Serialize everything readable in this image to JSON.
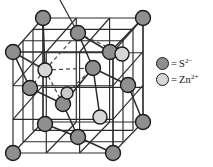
{
  "figure": {
    "name": "zinc-blende-unit-cell",
    "background_color": "#ffffff"
  },
  "colors": {
    "anion_fill": "#8f8f8f",
    "cation_fill": "#d6d6d6",
    "outline": "#1b1b1b",
    "edge_line": "#2b2b2b",
    "bond_line": "#2b2b2b",
    "dashed_line": "#4a4a4a"
  },
  "legend": {
    "name": "species-legend",
    "items": [
      {
        "swatch": "anion",
        "equals": "=",
        "formula": "S",
        "charge": "2−",
        "label": "= S2−"
      },
      {
        "swatch": "cation",
        "equals": "=",
        "formula": "Zn",
        "charge": "2+",
        "label": "= Zn2+"
      }
    ]
  },
  "lattice": {
    "cube": {
      "front_face": [
        [
          13,
          52
        ],
        [
          113,
          52
        ],
        [
          113,
          153
        ],
        [
          13,
          153
        ]
      ],
      "back_face": [
        [
          43,
          18
        ],
        [
          143,
          18
        ],
        [
          143,
          122
        ],
        [
          43,
          122
        ]
      ],
      "connectors": [
        [
          [
            13,
            52
          ],
          [
            43,
            18
          ]
        ],
        [
          [
            113,
            52
          ],
          [
            143,
            18
          ]
        ],
        [
          [
            113,
            153
          ],
          [
            143,
            122
          ]
        ],
        [
          [
            13,
            153
          ],
          [
            43,
            122
          ]
        ]
      ]
    },
    "grid_lines_per_face": 2,
    "anions": [
      {
        "id": "S-back-top-left",
        "x": 43,
        "y": 18,
        "r": 7.5
      },
      {
        "id": "S-back-top-right",
        "x": 143,
        "y": 18,
        "r": 7.5
      },
      {
        "id": "S-front-top-left",
        "x": 13,
        "y": 52,
        "r": 7.5
      },
      {
        "id": "S-top-face-center",
        "x": 78,
        "y": 33,
        "r": 7.5
      },
      {
        "id": "S-right-face-upper",
        "x": 110,
        "y": 52,
        "r": 7.5
      },
      {
        "id": "S-interior-center",
        "x": 93,
        "y": 68,
        "r": 7.5
      },
      {
        "id": "S-left-face-center",
        "x": 30,
        "y": 88,
        "r": 7.5
      },
      {
        "id": "S-front-face-center",
        "x": 63,
        "y": 104,
        "r": 7.5
      },
      {
        "id": "S-right-face-center",
        "x": 128,
        "y": 85,
        "r": 7.5
      },
      {
        "id": "S-bottom-face-center",
        "x": 78,
        "y": 137,
        "r": 7.5
      },
      {
        "id": "S-back-bottom-right",
        "x": 143,
        "y": 122,
        "r": 7.5
      },
      {
        "id": "S-front-bottom-left",
        "x": 13,
        "y": 153,
        "r": 7.5
      },
      {
        "id": "S-front-bottom-right",
        "x": 113,
        "y": 153,
        "r": 7.5
      },
      {
        "id": "S-back-bottom-left",
        "x": 45,
        "y": 124,
        "r": 7.5
      }
    ],
    "cations": [
      {
        "id": "Zn-upper-left-interior",
        "x": 45,
        "y": 70,
        "r": 7.0
      },
      {
        "id": "Zn-upper-right-interior",
        "x": 122,
        "y": 54,
        "r": 7.0
      },
      {
        "id": "Zn-mid-interior",
        "x": 67,
        "y": 93,
        "r": 6.0
      },
      {
        "id": "Zn-lower-right-interior",
        "x": 100,
        "y": 117,
        "r": 7.0
      }
    ],
    "bonds_solid": [
      [
        [
          45,
          70
        ],
        [
          43,
          18
        ]
      ],
      [
        [
          78,
          33
        ],
        [
          110,
          52
        ]
      ],
      [
        [
          78,
          33
        ],
        [
          93,
          68
        ]
      ],
      [
        [
          122,
          54
        ],
        [
          110,
          52
        ]
      ],
      [
        [
          63,
          104
        ],
        [
          67,
          93
        ]
      ],
      [
        [
          63,
          104
        ],
        [
          93,
          68
        ]
      ],
      [
        [
          100,
          117
        ],
        [
          93,
          68
        ]
      ]
    ],
    "bonds_dashed": [
      [
        [
          45,
          70
        ],
        [
          13,
          52
        ]
      ],
      [
        [
          45,
          70
        ],
        [
          78,
          33
        ]
      ],
      [
        [
          45,
          70
        ],
        [
          30,
          88
        ]
      ],
      [
        [
          45,
          70
        ],
        [
          63,
          104
        ]
      ],
      [
        [
          78,
          33
        ],
        [
          122,
          54
        ]
      ],
      [
        [
          45,
          70
        ],
        [
          93,
          68
        ]
      ]
    ],
    "leader_line": {
      "name": "callout-leader",
      "from": [
        78,
        33
      ],
      "to": [
        60,
        0
      ]
    }
  }
}
